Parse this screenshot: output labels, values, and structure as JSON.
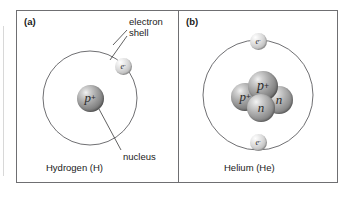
{
  "figure": {
    "background_color": "#ffffff",
    "frame_color": "#6f6f72",
    "panels": [
      {
        "tag": "(a)",
        "caption": "Hydrogen (H)",
        "shell": {
          "cx": 90,
          "cy": 98,
          "r": 47,
          "stroke": "#5f5f62"
        },
        "particles": [
          {
            "kind": "proton",
            "label": "p",
            "charge": "+",
            "cx": 90,
            "cy": 98,
            "r": 13.5
          },
          {
            "kind": "electron",
            "label": "e",
            "charge": "-",
            "cx": 123,
            "cy": 66,
            "r": 8.5
          }
        ],
        "annotations": [
          {
            "name": "electron-shell",
            "lines": [
              "electron",
              "shell"
            ],
            "text_x": 129,
            "text_y": 16,
            "leaders": [
              {
                "x1": 127,
                "y1": 30,
                "x2": 113,
                "y2": 45
              },
              {
                "x1": 127,
                "y1": 36,
                "x2": 110,
                "y2": 60
              }
            ]
          },
          {
            "name": "nucleus",
            "lines": [
              "nucleus"
            ],
            "text_x": 123,
            "text_y": 151,
            "leaders": [
              {
                "x1": 121,
                "y1": 150,
                "x2": 99,
                "y2": 109
              }
            ]
          }
        ]
      },
      {
        "tag": "(b)",
        "caption": "Helium (He)",
        "shell": {
          "cx": 258,
          "cy": 95,
          "r": 55,
          "stroke": "#5f5f62"
        },
        "particles": [
          {
            "kind": "proton",
            "label": "p",
            "charge": "+",
            "cx": 263,
            "cy": 86,
            "r": 15
          },
          {
            "kind": "proton",
            "label": "p",
            "charge": "+",
            "cx": 245,
            "cy": 97,
            "r": 14
          },
          {
            "kind": "neutron",
            "label": "n",
            "charge": "",
            "cx": 279,
            "cy": 100,
            "r": 14
          },
          {
            "kind": "neutron",
            "label": "n",
            "charge": "",
            "cx": 261,
            "cy": 108,
            "r": 14
          },
          {
            "kind": "electron",
            "label": "e",
            "charge": "-",
            "cx": 258,
            "cy": 41,
            "r": 8.5
          },
          {
            "kind": "electron",
            "label": "e",
            "charge": "-",
            "cx": 258,
            "cy": 142,
            "r": 8.5
          }
        ],
        "annotations": []
      }
    ]
  },
  "glossary": {
    "proton_symbol": "p+",
    "neutron_symbol": "n",
    "electron_symbol": "e-",
    "electron_shell_label": "electron shell",
    "nucleus_label": "nucleus"
  }
}
